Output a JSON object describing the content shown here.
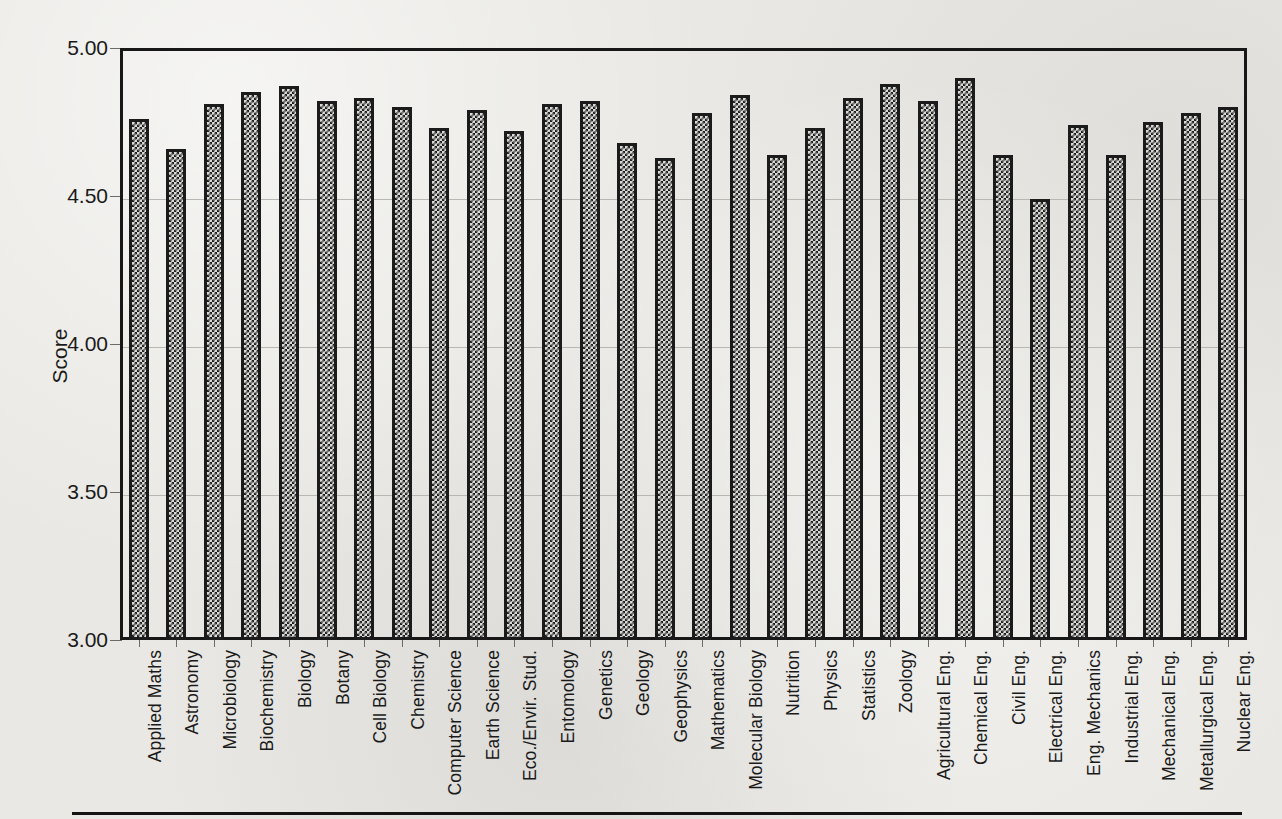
{
  "figure": {
    "ylabel": "Score",
    "y_ticks": [
      "3.00",
      "3.50",
      "4.00",
      "4.50",
      "5.00"
    ]
  },
  "chart_data": {
    "type": "bar",
    "title": "",
    "xlabel": "",
    "ylabel": "Score",
    "ylim": [
      3.0,
      5.0
    ],
    "ytick_values": [
      3.0,
      3.5,
      4.0,
      4.5,
      5.0
    ],
    "grid": true,
    "legend": "none",
    "orientation": "vertical",
    "bar_fill": "checkerboard-hatch",
    "categories": [
      "Applied Maths",
      "Astronomy",
      "Microbiology",
      "Biochemistry",
      "Biology",
      "Botany",
      "Cell Biology",
      "Chemistry",
      "Computer Science",
      "Earth Science",
      "Eco./Envir. Stud.",
      "Entomology",
      "Genetics",
      "Geology",
      "Geophysics",
      "Mathematics",
      "Molecular Biology",
      "Nutrition",
      "Physics",
      "Statistics",
      "Zoology",
      "Agricultural Eng.",
      "Chemical Eng.",
      "Civil Eng.",
      "Electrical Eng.",
      "Eng. Mechanics",
      "Industrial Eng.",
      "Mechanical Eng.",
      "Metallurgical Eng.",
      "Nuclear Eng."
    ],
    "values": [
      4.76,
      4.66,
      4.81,
      4.85,
      4.87,
      4.82,
      4.83,
      4.8,
      4.73,
      4.79,
      4.72,
      4.81,
      4.82,
      4.68,
      4.63,
      4.78,
      4.84,
      4.64,
      4.73,
      4.83,
      4.88,
      4.82,
      4.9,
      4.64,
      4.49,
      4.74,
      4.64,
      4.75,
      4.78,
      4.8
    ]
  },
  "colors": {
    "bar_outline": "#1b1b1b",
    "bar_fill": "#1f1f1f",
    "axis": "#171717",
    "grid": "#b9b7b2",
    "text": "#1a1a1a",
    "paper": "#e9e8e4"
  }
}
